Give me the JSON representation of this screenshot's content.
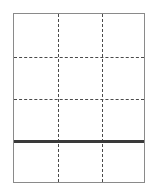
{
  "diagram": {
    "type": "grid-layout",
    "columns": 3,
    "rows": 4,
    "frame": {
      "x": 13,
      "y": 13,
      "width": 132,
      "height": 170,
      "border_color": "#8a8a8a"
    },
    "vertical_dashed_lines_x": [
      44,
      88
    ],
    "horizontal_dashed_lines_y": [
      43,
      85
    ],
    "thick_line": {
      "y": 127,
      "color": "#3a3a3a",
      "thickness": 3
    },
    "dash_color": "#4a4a4a"
  }
}
